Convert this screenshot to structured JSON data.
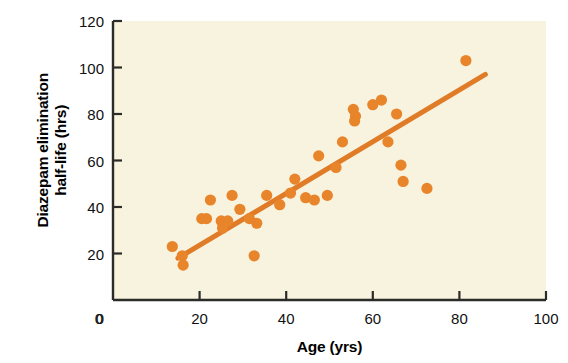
{
  "chart_data": {
    "type": "scatter",
    "title": "",
    "xlabel": "Age (yrs)",
    "ylabel": "Diazepam elimination half-life (hrs)",
    "ylabel_line1": "Diazepam elimination",
    "ylabel_line2": "half-life (hrs)",
    "xlim": [
      0,
      100
    ],
    "ylim": [
      0,
      120
    ],
    "xticks": [
      "0",
      "20",
      "40",
      "60",
      "80",
      "100"
    ],
    "xtick_values": [
      0,
      20,
      40,
      60,
      80,
      100
    ],
    "yticks": [
      "0",
      "20",
      "40",
      "60",
      "80",
      "100",
      "120"
    ],
    "ytick_values": [
      0,
      20,
      40,
      60,
      80,
      100,
      120
    ],
    "grid": false,
    "legend": null,
    "marker_color": "#E8842A",
    "line_color": "#E07B28",
    "plot_background": "#F7F3DF",
    "axis_color": "#2B2B28",
    "points": [
      [
        13.7,
        23
      ],
      [
        16.0,
        19
      ],
      [
        16.2,
        15
      ],
      [
        20.5,
        35
      ],
      [
        21.6,
        35
      ],
      [
        22.5,
        43
      ],
      [
        25.0,
        34
      ],
      [
        25.3,
        31
      ],
      [
        26.5,
        34
      ],
      [
        27.5,
        45
      ],
      [
        29.3,
        39
      ],
      [
        31.5,
        35
      ],
      [
        32.6,
        19
      ],
      [
        33.2,
        33
      ],
      [
        35.5,
        45
      ],
      [
        38.5,
        41
      ],
      [
        41.0,
        46
      ],
      [
        42.0,
        52
      ],
      [
        44.5,
        44
      ],
      [
        46.5,
        43
      ],
      [
        47.5,
        62
      ],
      [
        49.5,
        45
      ],
      [
        51.5,
        57
      ],
      [
        53.0,
        68
      ],
      [
        55.5,
        82
      ],
      [
        55.8,
        77
      ],
      [
        56.0,
        79
      ],
      [
        60.0,
        84
      ],
      [
        62.0,
        86
      ],
      [
        63.5,
        68
      ],
      [
        65.5,
        80
      ],
      [
        66.5,
        58
      ],
      [
        67.0,
        51
      ],
      [
        72.5,
        48
      ],
      [
        81.5,
        103
      ]
    ],
    "trendline": {
      "x": [
        15.0,
        86.0
      ],
      "y": [
        18.0,
        97.0
      ]
    }
  }
}
